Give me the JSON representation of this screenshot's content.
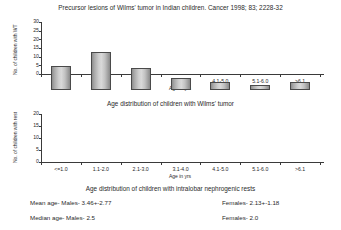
{
  "document": {
    "title": "Precursor lesions of Wilms' tumor in Indian children. Cancer 1998; 83; 2228-32"
  },
  "chart_data": [
    {
      "type": "bar",
      "id": "wilms-tumor-age-distribution",
      "title": "Age distribution of children with Wilms' tumor",
      "title_position": "below",
      "xlabel": "Age in yrs",
      "ylabel": "No. of children with WT",
      "categories": [
        "<=1.0",
        "1.1-2.0",
        "2.1-3.0",
        "3.1-4.0",
        "4.1-5.0",
        "5.1-6.0",
        ">6.1"
      ],
      "values": [
        23,
        26,
        26,
        12,
        11.5,
        10,
        7
      ],
      "yticks": [
        0,
        5,
        10,
        15,
        20,
        25,
        30
      ],
      "ylim": [
        0,
        30
      ],
      "grid": false,
      "legend": "none"
    },
    {
      "type": "bar",
      "id": "nephrogenic-rests-age-distribution",
      "title": "Age distribution of children with intralobar nephrogenic rests",
      "title_position": "below",
      "xlabel": "Age in yrs",
      "ylabel": "No. of children with rest",
      "categories": [
        "<=1.0",
        "1.1-2.0",
        "2.1-3.0",
        "3.1-4.0",
        "4.1-5.0",
        "5.1-6.0",
        ">6.1"
      ],
      "values": [
        10,
        16,
        9,
        5,
        3.5,
        2,
        3.5
      ],
      "yticks": [
        0,
        5,
        10,
        15,
        20
      ],
      "ylim": [
        0,
        20
      ],
      "grid": false,
      "legend": "none"
    }
  ],
  "statistics": {
    "mean": {
      "label": "Mean age- Males- 3.46+-2.77",
      "females": "Females- 2.13+-1.18"
    },
    "median": {
      "label": "Median age- Males- 2.5",
      "females": "Females- 2.0"
    }
  }
}
